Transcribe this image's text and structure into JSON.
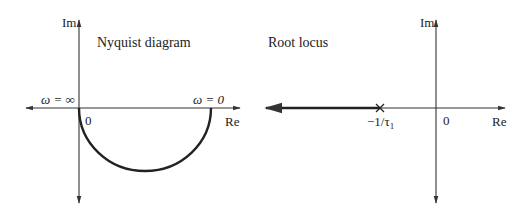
{
  "nyquist": {
    "title": "Nyquist diagram",
    "im_label": "Im",
    "re_label": "Re",
    "origin_label": "0",
    "omega_inf_label": "ω = ∞",
    "omega_zero_label": "ω = 0"
  },
  "root_locus": {
    "title": "Root locus",
    "im_label": "Im",
    "re_label": "Re",
    "origin_label": "0",
    "pole_label": "−1/τ",
    "pole_subscript": "1",
    "pole_marker": "X"
  },
  "colors": {
    "axis": "#333333",
    "curve": "#222222",
    "text": "#222222",
    "background": "#ffffff"
  }
}
